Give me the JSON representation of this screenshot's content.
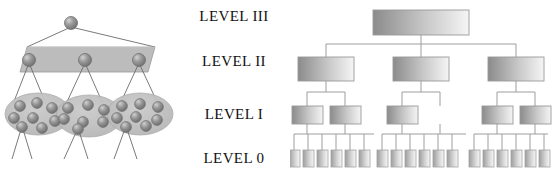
{
  "figure": {
    "width": 552,
    "height": 179,
    "background": "#ffffff"
  },
  "labels": {
    "level_3": "LEVEL III",
    "level_2": "LEVEL II",
    "level_1": "LEVEL I",
    "level_0": "LEVEL 0"
  },
  "colors": {
    "sphere_fill": "#8c8c8c",
    "sphere_highlight": "#c8c8c8",
    "sphere_stroke": "#6e6e6e",
    "slab_fill": "#bcbcbc",
    "slab_stroke": "#8a8a8a",
    "ellipse_fill": "#c2c2c2",
    "ellipse_stroke": "#a8a8a8",
    "line_stroke": "#6b6b6b",
    "box_gradient_dark": "#8f8f8f",
    "box_gradient_light": "#f2f2f2",
    "box_stroke": "#9a9a9a",
    "connector_stroke": "#9e9e9e",
    "text": "#111111"
  },
  "left_diagram": {
    "name": "hierarchical-granule-diagram",
    "level_3_nodes": 1,
    "level_2_nodes": 3,
    "level_1_granules": 3,
    "level_1_spheres_per_granule": [
      7,
      7,
      7
    ],
    "level_0_edges_per_granule": 2
  },
  "right_diagram": {
    "name": "hierarchical-tree-diagram",
    "type": "tree",
    "level_3_boxes": 1,
    "level_2_boxes": 3,
    "level_1_boxes": 5,
    "level_0_boxes": 18
  }
}
